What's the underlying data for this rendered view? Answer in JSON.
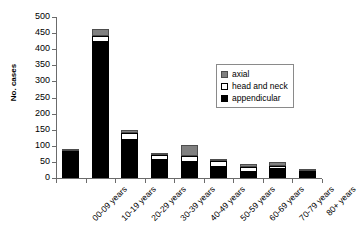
{
  "chart_data": {
    "type": "bar",
    "stacked": true,
    "title": "",
    "xlabel": "",
    "ylabel": "No. cases",
    "ylim": [
      0,
      500
    ],
    "ytick_step": 50,
    "yticks": [
      0,
      50,
      100,
      150,
      200,
      250,
      300,
      350,
      400,
      450,
      500
    ],
    "grid": false,
    "legend_position": "upper right",
    "categories": [
      "00-09 years",
      "10-19 years",
      "20-29 years",
      "30-39 years",
      "40-49 years",
      "50-59 years",
      "60-69 years",
      "70-79 years",
      "80+ years"
    ],
    "series": [
      {
        "name": "appendicular",
        "color": "#000000",
        "values": [
          78,
          422,
          118,
          55,
          50,
          35,
          18,
          28,
          15
        ]
      },
      {
        "name": "head and neck",
        "color": "#ffffff",
        "values": [
          5,
          18,
          22,
          15,
          18,
          17,
          15,
          10,
          7
        ]
      },
      {
        "name": "axial",
        "color": "#808080",
        "values": [
          2,
          22,
          10,
          8,
          34,
          6,
          9,
          12,
          6
        ]
      }
    ],
    "totals": [
      85,
      462,
      150,
      78,
      102,
      58,
      42,
      50,
      28
    ]
  },
  "legend": {
    "items": [
      {
        "label": "axial",
        "swatch": "axial-swatch"
      },
      {
        "label": "head and neck",
        "swatch": "head-and-neck-swatch"
      },
      {
        "label": "appendicular",
        "swatch": "appendicular-swatch"
      }
    ]
  }
}
